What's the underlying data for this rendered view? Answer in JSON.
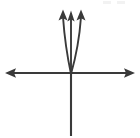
{
  "figure": {
    "background_color": "#ffffff",
    "stroke_color": "#3a3a3a",
    "axis_color": "#3a3a3a",
    "width": 140,
    "height": 138
  },
  "axes": {
    "x_axis": {
      "label": "horizontal-axis",
      "y_position": 73,
      "x_start": 6,
      "x_end": 134,
      "arrow_left": true,
      "arrow_right": true
    },
    "y_axis": {
      "label": "vertical-axis",
      "x_position": 71,
      "y_top": 73,
      "y_bottom": 136,
      "arrow_top": false,
      "arrow_bottom": false
    },
    "origin": {
      "x": 71,
      "y": 73
    }
  },
  "chart_data": {
    "type": "line",
    "xlabel": "",
    "ylabel": "",
    "grid": false,
    "legend": false,
    "axis_arrows": {
      "x_left": true,
      "x_right": true,
      "y_up": false,
      "y_down": false
    },
    "origin_pixel": {
      "x": 71,
      "y": 73
    },
    "series": [
      {
        "name": "left-branch",
        "shape": "parabolic",
        "arrow_end": "up",
        "tip_pixel": {
          "x": 63,
          "y": 12
        },
        "points": [
          {
            "x": 71,
            "y": 73
          },
          {
            "x": 68,
            "y": 60
          },
          {
            "x": 65,
            "y": 45
          },
          {
            "x": 63.6,
            "y": 30
          },
          {
            "x": 63,
            "y": 16
          }
        ]
      },
      {
        "name": "middle-line",
        "shape": "straight",
        "arrow_end": "up",
        "tip_pixel": {
          "x": 71,
          "y": 13
        },
        "points": [
          {
            "x": 71,
            "y": 73
          },
          {
            "x": 71,
            "y": 55
          },
          {
            "x": 71,
            "y": 38
          },
          {
            "x": 71,
            "y": 22
          },
          {
            "x": 71,
            "y": 17
          }
        ]
      },
      {
        "name": "right-branch",
        "shape": "parabolic",
        "arrow_end": "up",
        "tip_pixel": {
          "x": 81,
          "y": 12
        },
        "points": [
          {
            "x": 71,
            "y": 73
          },
          {
            "x": 75,
            "y": 60
          },
          {
            "x": 79,
            "y": 45
          },
          {
            "x": 80.6,
            "y": 30
          },
          {
            "x": 81,
            "y": 16
          }
        ]
      }
    ]
  },
  "icons": {
    "arrow_up": "up-arrow-head",
    "arrow_left": "left-arrow-head",
    "arrow_right": "right-arrow-head"
  }
}
